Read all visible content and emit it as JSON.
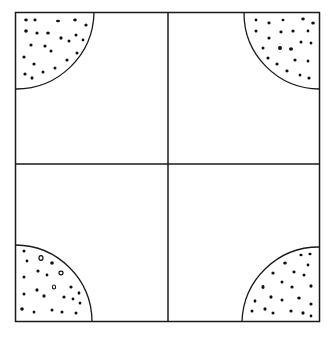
{
  "diagram": {
    "colors": {
      "background": "#ffffff",
      "stroke": "#1a1a1a",
      "dots": "#111111"
    },
    "square": {
      "x": 15,
      "y": 12,
      "width": 305,
      "height": 310
    },
    "dividers": {
      "vertical_x": 168,
      "horizontal_y": 164
    },
    "corner_radius": 78,
    "corners": [
      {
        "id": "top-left",
        "label": ""
      },
      {
        "id": "top-right",
        "label": ""
      },
      {
        "id": "bottom-left",
        "label": ""
      },
      {
        "id": "bottom-right",
        "label": ""
      }
    ]
  }
}
